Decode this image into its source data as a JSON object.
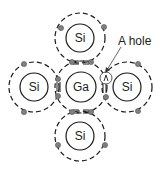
{
  "diagram": {
    "atoms": [
      {
        "id": "top",
        "label": "Si",
        "cx": 80,
        "cy": 38
      },
      {
        "id": "left",
        "label": "Si",
        "cx": 34,
        "cy": 87
      },
      {
        "id": "center",
        "label": "Ga",
        "cx": 81,
        "cy": 87
      },
      {
        "id": "right",
        "label": "Si",
        "cx": 127,
        "cy": 87
      },
      {
        "id": "bottom",
        "label": "Si",
        "cx": 80,
        "cy": 136
      }
    ],
    "annotation": {
      "label": "A hole"
    },
    "colors": {
      "line": "#1a1a1a",
      "electron": "#808080",
      "background": "#ffffff"
    }
  }
}
